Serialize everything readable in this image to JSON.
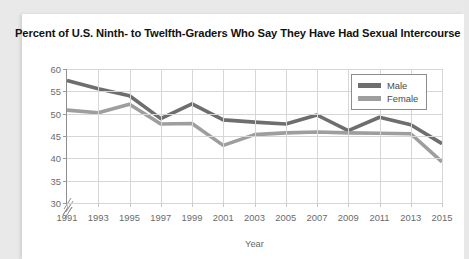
{
  "card": {
    "background_color": "#ffffff",
    "page_background_color": "#e9e9e9"
  },
  "chart_data": {
    "type": "line",
    "title": "Percent of U.S. Ninth- to Twelfth-Graders Who Say They Have Had Sexual Intercourse",
    "xlabel": "Year",
    "ylabel": "",
    "categories": [
      1991,
      1993,
      1995,
      1997,
      1999,
      2001,
      2003,
      2005,
      2007,
      2009,
      2011,
      2013,
      2015
    ],
    "x": [
      "1991",
      "1993",
      "1995",
      "1997",
      "1999",
      "2001",
      "2003",
      "2005",
      "2007",
      "2009",
      "2011",
      "2013",
      "2015"
    ],
    "xlim": [
      1991,
      2015
    ],
    "ylim": [
      30,
      60
    ],
    "yticks": [
      30,
      35,
      40,
      45,
      50,
      55,
      60
    ],
    "ytick_labels": [
      "30",
      "35",
      "40",
      "45",
      "50",
      "55",
      "60"
    ],
    "xticks": [
      1991,
      1993,
      1995,
      1997,
      1999,
      2001,
      2003,
      2005,
      2007,
      2009,
      2011,
      2013,
      2015
    ],
    "y_axis_broken": true,
    "x_axis_broken": true,
    "grid": true,
    "legend_position": "top-right",
    "series": [
      {
        "name": "Male",
        "color": "#6e6e6e",
        "values": [
          57.4,
          55.6,
          54.0,
          48.9,
          52.2,
          48.6,
          48.1,
          47.7,
          49.7,
          46.2,
          49.2,
          47.5,
          43.3
        ]
      },
      {
        "name": "Female",
        "color": "#9e9e9e",
        "values": [
          50.8,
          50.2,
          52.1,
          47.7,
          47.8,
          42.9,
          45.3,
          45.7,
          45.9,
          45.7,
          45.6,
          45.5,
          39.2
        ]
      }
    ]
  },
  "legend": {
    "items": [
      {
        "label": "Male",
        "color": "#6e6e6e"
      },
      {
        "label": "Female",
        "color": "#9e9e9e"
      }
    ]
  }
}
